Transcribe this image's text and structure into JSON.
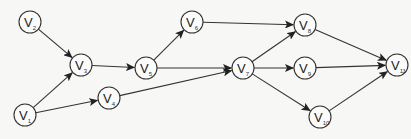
{
  "graph": {
    "type": "directed",
    "node_radius": 11,
    "colors": {
      "stroke": "#333333",
      "node_fill": "#fbfbfa",
      "background": "#f7f7f5"
    },
    "nodes": [
      {
        "id": "V1",
        "label": "V",
        "sub": "1",
        "x": 25,
        "y": 115
      },
      {
        "id": "V2",
        "label": "V",
        "sub": "2",
        "x": 30,
        "y": 22
      },
      {
        "id": "V3",
        "label": "V",
        "sub": "3",
        "x": 81,
        "y": 65
      },
      {
        "id": "V4",
        "label": "V",
        "sub": "4",
        "x": 109,
        "y": 98
      },
      {
        "id": "V5",
        "label": "V",
        "sub": "5",
        "x": 146,
        "y": 68
      },
      {
        "id": "V6",
        "label": "V",
        "sub": "6",
        "x": 192,
        "y": 22
      },
      {
        "id": "V7",
        "label": "V",
        "sub": "7",
        "x": 243,
        "y": 68
      },
      {
        "id": "V8",
        "label": "V",
        "sub": "8",
        "x": 305,
        "y": 25
      },
      {
        "id": "V9",
        "label": "V",
        "sub": "9",
        "x": 305,
        "y": 68
      },
      {
        "id": "V10",
        "label": "V",
        "sub": "10",
        "x": 320,
        "y": 117
      },
      {
        "id": "V11",
        "label": "V",
        "sub": "11",
        "x": 397,
        "y": 65
      }
    ],
    "edges": [
      {
        "from": "V2",
        "to": "V3"
      },
      {
        "from": "V1",
        "to": "V3"
      },
      {
        "from": "V1",
        "to": "V4"
      },
      {
        "from": "V3",
        "to": "V5"
      },
      {
        "from": "V5",
        "to": "V6"
      },
      {
        "from": "V5",
        "to": "V7"
      },
      {
        "from": "V4",
        "to": "V7"
      },
      {
        "from": "V6",
        "to": "V8"
      },
      {
        "from": "V7",
        "to": "V8"
      },
      {
        "from": "V7",
        "to": "V9"
      },
      {
        "from": "V7",
        "to": "V10"
      },
      {
        "from": "V8",
        "to": "V11"
      },
      {
        "from": "V9",
        "to": "V11"
      },
      {
        "from": "V10",
        "to": "V11"
      }
    ]
  }
}
